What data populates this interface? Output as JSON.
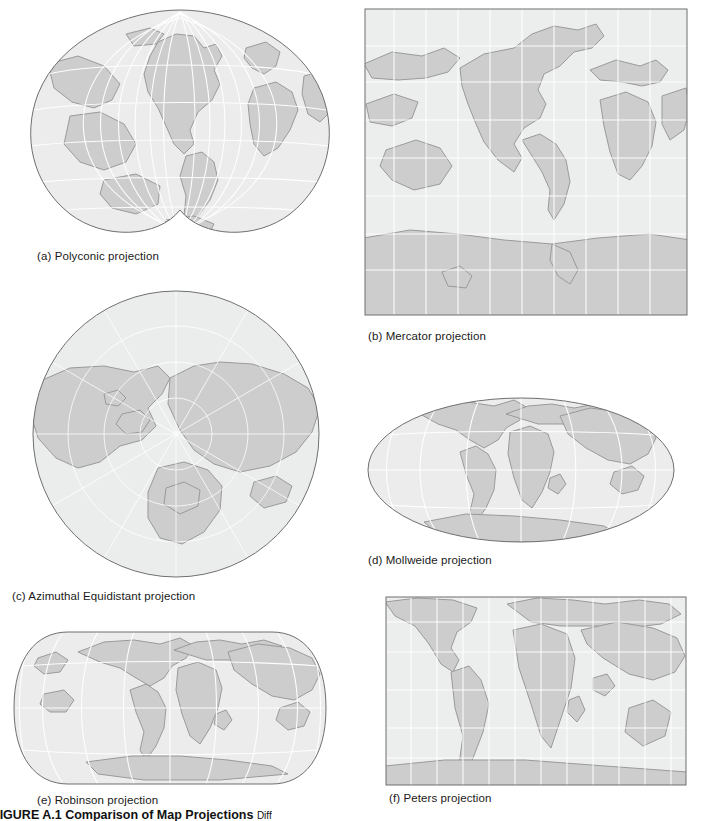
{
  "figure": {
    "number": "FIGURE A.1",
    "title": "Comparison of Map Projections",
    "trailing": "Diff"
  },
  "panels": [
    {
      "id": "a",
      "label": "(a) Polyconic projection",
      "projection": "polyconic",
      "shape": "bi-lobed"
    },
    {
      "id": "b",
      "label": "(b) Mercator projection",
      "projection": "mercator",
      "shape": "square"
    },
    {
      "id": "c",
      "label": "(c) Azimuthal Equidistant projection",
      "projection": "azimuthal",
      "shape": "circle"
    },
    {
      "id": "d",
      "label": "(d) Mollweide projection",
      "projection": "mollweide",
      "shape": "ellipse"
    },
    {
      "id": "e",
      "label": "(e) Robinson projection",
      "projection": "robinson",
      "shape": "rounded-rectangle"
    },
    {
      "id": "f",
      "label": "(f) Peters projection",
      "projection": "peters",
      "shape": "rectangle"
    }
  ],
  "style": {
    "land_fill": "#cdcdcd",
    "land_stroke": "#9a9a9a",
    "ocean_fill": "#eceded",
    "graticule": "#ffffff",
    "frame": "#6f6f6f",
    "background": "#ffffff",
    "caption_color": "#1a1a1a"
  }
}
